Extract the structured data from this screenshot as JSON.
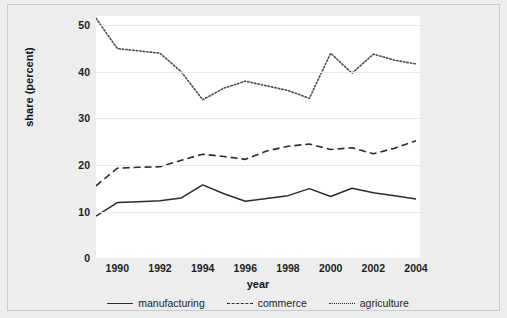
{
  "chart_data": {
    "type": "line",
    "title": "",
    "xlabel": "year",
    "ylabel": "share (percent)",
    "xlim": [
      1989,
      2004
    ],
    "ylim": [
      0,
      52
    ],
    "grid": true,
    "legend_position": "bottom",
    "x": [
      1989,
      1990,
      1991,
      1992,
      1993,
      1994,
      1995,
      1996,
      1997,
      1998,
      1999,
      2000,
      2001,
      2002,
      2003,
      2004
    ],
    "xticks": [
      "1990",
      "1992",
      "1994",
      "1996",
      "1998",
      "2000",
      "2002",
      "2004"
    ],
    "xtick_values": [
      1990,
      1992,
      1994,
      1996,
      1998,
      2000,
      2002,
      2004
    ],
    "yticks": [
      "0",
      "10",
      "20",
      "30",
      "40",
      "50"
    ],
    "ytick_values": [
      0,
      10,
      20,
      30,
      40,
      50
    ],
    "series": [
      {
        "name": "manufacturing",
        "style": "solid",
        "color": "#2b2b2b",
        "values": [
          9.0,
          11.9,
          12.1,
          12.3,
          12.9,
          15.7,
          13.8,
          12.2,
          12.8,
          13.4,
          14.9,
          13.2,
          15.0,
          14.0,
          13.4,
          12.7
        ]
      },
      {
        "name": "commerce",
        "style": "dashed",
        "color": "#2b2b2b",
        "values": [
          15.5,
          19.3,
          19.5,
          19.6,
          21.0,
          22.3,
          21.8,
          21.2,
          23.0,
          24.0,
          24.5,
          23.3,
          23.7,
          22.4,
          23.6,
          25.2
        ]
      },
      {
        "name": "agriculture",
        "style": "dotted",
        "color": "#4a4a4a",
        "values": [
          51.5,
          45.0,
          44.5,
          44.0,
          40.0,
          34.0,
          36.5,
          38.0,
          37.0,
          36.0,
          34.3,
          44.0,
          39.7,
          43.8,
          42.5,
          41.7
        ]
      }
    ]
  },
  "legend": {
    "items": [
      {
        "label": "manufacturing"
      },
      {
        "label": "commerce"
      },
      {
        "label": "agriculture"
      }
    ]
  },
  "axes": {
    "y_title": "share (percent)",
    "x_title": "year"
  },
  "colors": {
    "figure_background": "#eceded",
    "plot_background": "#ffffff",
    "gridline": "#e8e8e8",
    "line": "#2b2b2b",
    "text": "#1c1c1c"
  }
}
